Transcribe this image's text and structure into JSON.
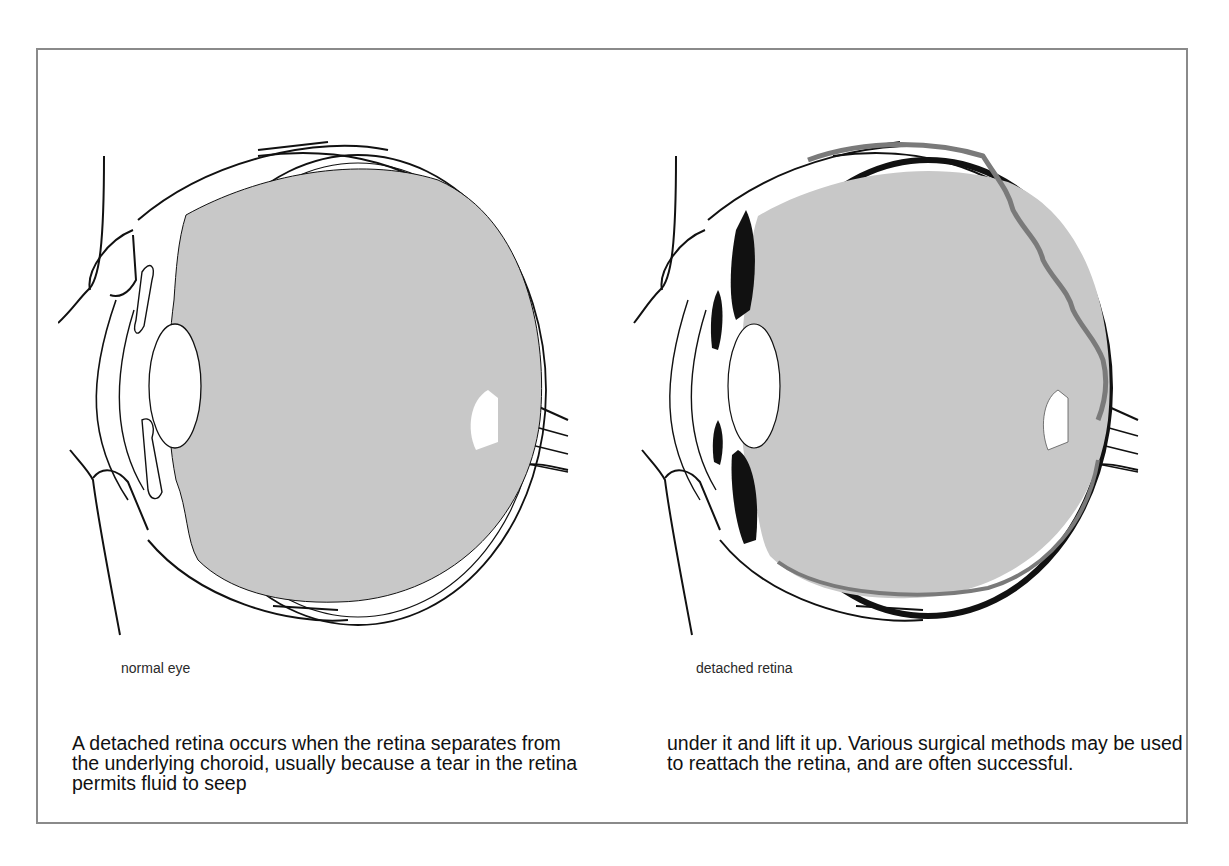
{
  "figures": {
    "normal": {
      "caption": "normal eye",
      "icon": "normal-eye-cross-section"
    },
    "detached": {
      "caption": "detached retina",
      "icon": "detached-retina-cross-section"
    }
  },
  "description": {
    "left_column": "A detached retina occurs when the retina separates from the underlying choroid, usually because a tear in the retina permits fluid to seep",
    "right_column": "under it and lift it up. Various surgical methods may be used to reattach the retina, and are often successful."
  },
  "colors": {
    "frame_border": "#8a8a8a",
    "vitreous_fill": "#c8c8c8",
    "detached_retina": "#7a7a7a",
    "choroid_dark": "#111111",
    "line": "#111111"
  }
}
